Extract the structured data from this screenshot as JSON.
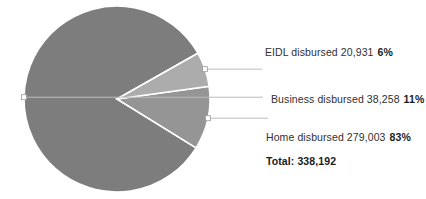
{
  "chart_data": {
    "type": "pie",
    "title": "",
    "categories": [
      "EIDL disbursed",
      "Business disbursed",
      "Home disbursed"
    ],
    "values": [
      20931,
      38258,
      279003
    ],
    "percent_labels": [
      "6%",
      "11%",
      "83%"
    ],
    "value_labels": [
      "20,931",
      "38,258",
      "279,003"
    ],
    "colors": [
      "#acacac",
      "#959595",
      "#7d7d7d"
    ],
    "total_value": 338192,
    "total_label": "Total: 338,192",
    "legend_position": "right-callout",
    "grid": false,
    "slices": [
      {
        "name": "EIDL disbursed",
        "value_label": "20,931",
        "percent_label": "6%",
        "value": 20931,
        "percent": 6,
        "color": "#acacac"
      },
      {
        "name": "Business disbursed",
        "value_label": "38,258",
        "percent_label": "11%",
        "value": 38258,
        "percent": 11,
        "color": "#959595"
      },
      {
        "name": "Home disbursed",
        "value_label": "279,003",
        "percent_label": "83%",
        "value": 279003,
        "percent": 83,
        "color": "#7d7d7d"
      }
    ]
  },
  "labels": {
    "eidl": {
      "text": "EIDL disbursed 20,931",
      "percent": "6%"
    },
    "business": {
      "text": "Business disbursed 38,258",
      "percent": "11%"
    },
    "home": {
      "text": "Home disbursed 279,003",
      "percent": "83%"
    },
    "total": "Total: 338,192"
  },
  "style": {
    "background": "#ffffff",
    "leader_line_color": "#b9b9b9",
    "slice_border_color": "#ffffff",
    "marker_fill": "#ffffff",
    "marker_stroke": "#9a9a9a"
  }
}
